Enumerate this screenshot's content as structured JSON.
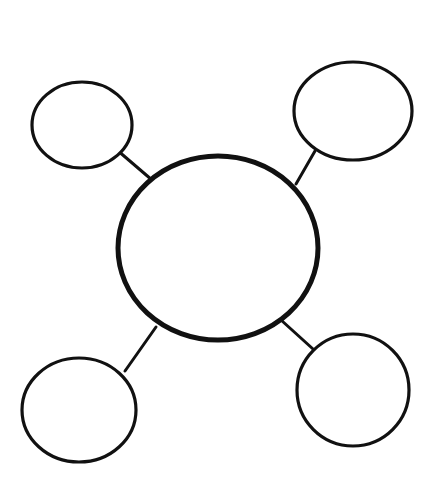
{
  "diagram": {
    "type": "bubble-map",
    "background": "#ffffff",
    "stroke_color": "#111111",
    "center": {
      "cx": 218,
      "cy": 248,
      "rx": 100,
      "ry": 92,
      "stroke_width": 5,
      "label": ""
    },
    "bubbles": [
      {
        "id": "top-left",
        "cx": 82,
        "cy": 125,
        "rx": 50,
        "ry": 43,
        "label": ""
      },
      {
        "id": "top-right",
        "cx": 353,
        "cy": 111,
        "rx": 59,
        "ry": 49,
        "label": ""
      },
      {
        "id": "bottom-left",
        "cx": 79,
        "cy": 410,
        "rx": 57,
        "ry": 52,
        "label": ""
      },
      {
        "id": "bottom-right",
        "cx": 353,
        "cy": 390,
        "rx": 56,
        "ry": 56,
        "label": ""
      }
    ],
    "connectors": [
      {
        "from": "center",
        "to": "top-left",
        "x1": 152,
        "y1": 180,
        "x2": 117,
        "y2": 150
      },
      {
        "from": "center",
        "to": "top-right",
        "x1": 296,
        "y1": 184,
        "x2": 315,
        "y2": 151
      },
      {
        "from": "center",
        "to": "bottom-left",
        "x1": 156,
        "y1": 327,
        "x2": 125,
        "y2": 371
      },
      {
        "from": "center",
        "to": "bottom-right",
        "x1": 281,
        "y1": 320,
        "x2": 313,
        "y2": 349
      }
    ]
  }
}
